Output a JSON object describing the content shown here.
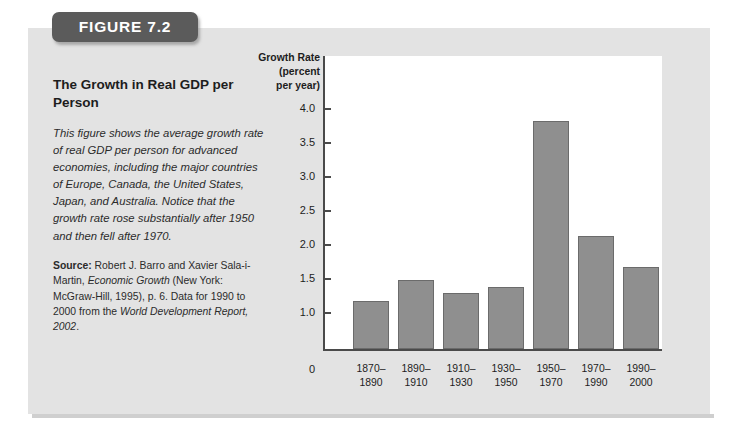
{
  "figure": {
    "banner_label": "FIGURE 7.2",
    "title": "The Growth in Real GDP per Person",
    "caption": "This figure shows the average growth rate of real GDP per person for advanced economies, including the major countries of Europe, Canada, the United States, Japan, and Australia. Notice that the growth rate rose substantially after 1950 and then fell after 1970.",
    "source_lead": "Source:",
    "source_part1": " Robert J. Barro and Xavier Sala-i-Martin, ",
    "source_italic1": "Economic Growth",
    "source_part2": " (New York: McGraw-Hill, 1995), p. 6. Data for 1990 to 2000 from the ",
    "source_italic2": "World Development Report, 2002",
    "source_part3": "."
  },
  "colors": {
    "panel_background": "#e3e3e3",
    "banner_background": "#5b5b5b",
    "bar_fill": "#8f8f8f",
    "bar_border": "#6b6b6b",
    "axis": "#4a4a4a",
    "plot_background": "#ffffff"
  },
  "chart_data": {
    "type": "bar",
    "title": "The Growth in Real GDP per Person",
    "xlabel": "",
    "ylabel": "Growth Rate (percent per year)",
    "ylabel_lines": [
      "Growth Rate",
      "(percent",
      "per year)"
    ],
    "categories": [
      "1870-1890",
      "1890-1910",
      "1910-1930",
      "1930-1950",
      "1950-1970",
      "1970-1990",
      "1990-2000"
    ],
    "category_lines": [
      [
        "1870–",
        "1890"
      ],
      [
        "1890–",
        "1910"
      ],
      [
        "1910–",
        "1930"
      ],
      [
        "1930–",
        "1950"
      ],
      [
        "1950–",
        "1970"
      ],
      [
        "1970–",
        "1990"
      ],
      [
        "1990–",
        "2000"
      ]
    ],
    "values": [
      1.17,
      1.49,
      1.3,
      1.38,
      3.82,
      2.13,
      1.67
    ],
    "ylim": [
      0,
      4.25
    ],
    "yticks": [
      0,
      1.0,
      1.5,
      2.0,
      2.5,
      3.0,
      3.5,
      4.0
    ],
    "ytick_labels": [
      "0",
      "1.0",
      "1.5",
      "2.0",
      "2.5",
      "3.0",
      "3.5",
      "4.0"
    ],
    "axis_break_below": 1.0,
    "grid": false,
    "legend": false
  }
}
